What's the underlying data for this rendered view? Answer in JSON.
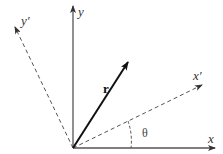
{
  "diagram": {
    "labels": {
      "x": "x",
      "y": "y",
      "x_prime": "x′",
      "y_prime": "y′",
      "r": "r",
      "theta": "θ"
    },
    "origin": [
      73,
      148
    ],
    "axes": {
      "x": {
        "from": [
          73,
          148
        ],
        "to": [
          215,
          148
        ],
        "style": "solid",
        "color": "#555555"
      },
      "y": {
        "from": [
          73,
          148
        ],
        "to": [
          73,
          6
        ],
        "style": "solid",
        "color": "#555555"
      },
      "x_prime": {
        "from": [
          73,
          148
        ],
        "to": [
          202,
          85
        ],
        "style": "dashed",
        "color": "#555555"
      },
      "y_prime": {
        "from": [
          73,
          148
        ],
        "to": [
          15,
          27
        ],
        "style": "dashed",
        "color": "#555555"
      }
    },
    "vector_r": {
      "from": [
        73,
        148
      ],
      "to": [
        128,
        62
      ],
      "color": "#111111"
    },
    "angle_arc": {
      "label": "θ",
      "between": [
        "x",
        "x_prime"
      ]
    }
  }
}
